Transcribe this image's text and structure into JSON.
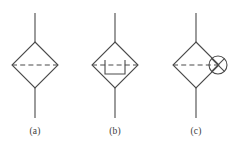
{
  "figure": {
    "type": "engineering-symbol-diagram",
    "background_color": "#ffffff",
    "line_color": "#4a4a4a",
    "caption_color": "#3b3b3b",
    "stroke_width": 1.1,
    "panels": [
      {
        "id": "a",
        "caption": "(a)",
        "symbol_name": "diamond-with-dashed-centerline",
        "center": {
          "x": 35,
          "y": 65
        },
        "diamond_half_width": 23,
        "diamond_half_height": 23,
        "stem_top_y": 13,
        "stem_bottom_y": 118,
        "dashed_line": {
          "x1": 12,
          "y1": 65,
          "x2": 58,
          "y2": 65
        },
        "has_inner_symbol": false,
        "has_side_circle": false
      },
      {
        "id": "b",
        "caption": "(b)",
        "symbol_name": "diamond-with-u-trap-and-dashed-centerline",
        "center": {
          "x": 115,
          "y": 65
        },
        "diamond_half_width": 23,
        "diamond_half_height": 23,
        "stem_top_y": 13,
        "stem_bottom_y": 118,
        "dashed_line": {
          "x1": 92,
          "y1": 65,
          "x2": 138,
          "y2": 65
        },
        "has_inner_symbol": true,
        "inner_symbol_name": "u-shape-trap",
        "inner_symbol": {
          "x1": 105,
          "x2": 125,
          "y_top": 60,
          "y_bottom": 74
        },
        "has_side_circle": false
      },
      {
        "id": "c",
        "caption": "(c)",
        "symbol_name": "diamond-with-dashed-centerline-and-circled-cross",
        "center": {
          "x": 196,
          "y": 65
        },
        "diamond_half_width": 23,
        "diamond_half_height": 23,
        "stem_top_y": 13,
        "stem_bottom_y": 118,
        "dashed_line": {
          "x1": 173,
          "y1": 65,
          "x2": 219,
          "y2": 65
        },
        "has_inner_symbol": false,
        "has_side_circle": true,
        "side_circle_name": "circled-cross",
        "side_circle": {
          "cx": 218,
          "cy": 65,
          "r": 9
        }
      }
    ]
  }
}
